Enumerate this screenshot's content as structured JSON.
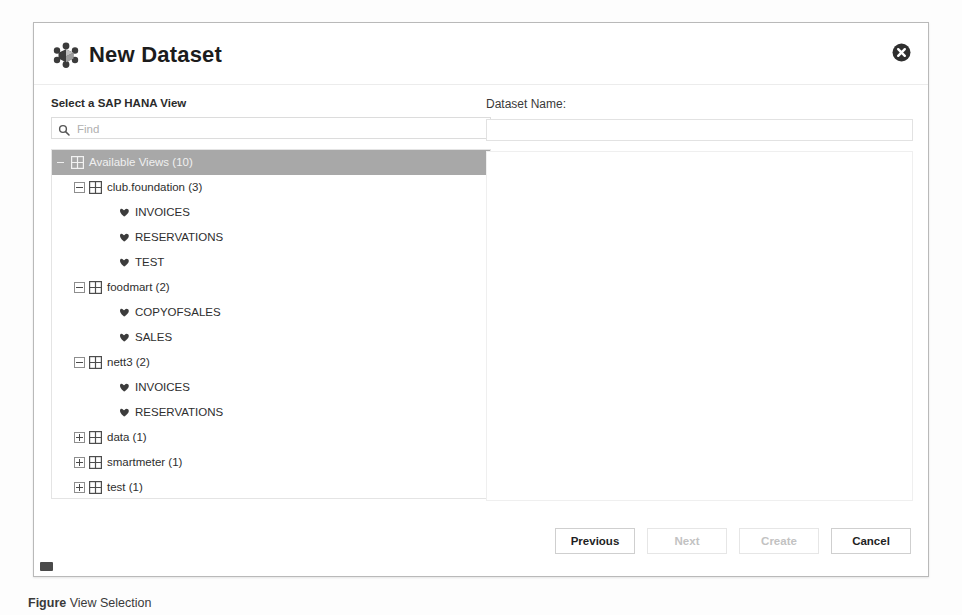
{
  "dialog": {
    "title": "New Dataset",
    "app_icon": "dataset-cube-icon",
    "close_icon": "close-icon"
  },
  "left_pane": {
    "label": "Select a SAP HANA View",
    "search": {
      "placeholder": "Find",
      "value": "",
      "icon": "search-icon"
    },
    "tree": [
      {
        "level": 0,
        "toggle": "minus-plain",
        "icon": "grid-icon",
        "label": "Available Views (10)",
        "selected": true
      },
      {
        "level": 1,
        "toggle": "minus-box",
        "icon": "grid-icon",
        "label": "club.foundation (3)",
        "selected": false
      },
      {
        "level": 2,
        "toggle": "none",
        "icon": "view-leaf-icon",
        "label": "INVOICES",
        "selected": false
      },
      {
        "level": 2,
        "toggle": "none",
        "icon": "view-leaf-icon",
        "label": "RESERVATIONS",
        "selected": false
      },
      {
        "level": 2,
        "toggle": "none",
        "icon": "view-leaf-icon",
        "label": "TEST",
        "selected": false
      },
      {
        "level": 1,
        "toggle": "minus-box",
        "icon": "grid-icon",
        "label": "foodmart (2)",
        "selected": false
      },
      {
        "level": 2,
        "toggle": "none",
        "icon": "view-leaf-icon",
        "label": "COPYOFSALES",
        "selected": false
      },
      {
        "level": 2,
        "toggle": "none",
        "icon": "view-leaf-icon",
        "label": "SALES",
        "selected": false
      },
      {
        "level": 1,
        "toggle": "minus-box",
        "icon": "grid-icon",
        "label": "nett3 (2)",
        "selected": false
      },
      {
        "level": 2,
        "toggle": "none",
        "icon": "view-leaf-icon",
        "label": "INVOICES",
        "selected": false
      },
      {
        "level": 2,
        "toggle": "none",
        "icon": "view-leaf-icon",
        "label": "RESERVATIONS",
        "selected": false
      },
      {
        "level": 1,
        "toggle": "plus-box",
        "icon": "grid-icon",
        "label": "data (1)",
        "selected": false
      },
      {
        "level": 1,
        "toggle": "plus-box",
        "icon": "grid-icon",
        "label": "smartmeter (1)",
        "selected": false
      },
      {
        "level": 1,
        "toggle": "plus-box",
        "icon": "grid-icon",
        "label": "test (1)",
        "selected": false
      }
    ]
  },
  "right_pane": {
    "label": "Dataset Name:",
    "name_field": {
      "value": "",
      "placeholder": ""
    }
  },
  "footer": {
    "buttons": [
      {
        "label": "Previous",
        "disabled": false
      },
      {
        "label": "Next",
        "disabled": true
      },
      {
        "label": "Create",
        "disabled": true
      },
      {
        "label": "Cancel",
        "disabled": false
      }
    ]
  },
  "caption": {
    "prefix": "Figure",
    "text": "View Selection"
  },
  "colors": {
    "selection": "#a8a8a8",
    "border": "#b9b9b9",
    "text": "#1c1c1c",
    "disabled_text": "#c2c2c2"
  }
}
